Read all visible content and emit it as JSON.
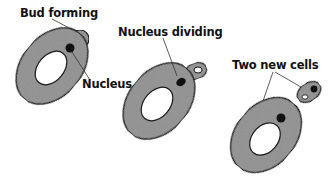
{
  "diagram": {
    "stages": [
      {
        "id": "stage-1",
        "labels": [
          "Bud forming",
          "Nucleus"
        ]
      },
      {
        "id": "stage-2",
        "labels": [
          "Nucleus dividing"
        ]
      },
      {
        "id": "stage-3",
        "labels": [
          "Two new cells"
        ]
      }
    ],
    "colors": {
      "cell_fill": "#9a9a9a",
      "outline": "#1a1a1a",
      "nucleus": "#111111",
      "background": "#ffffff"
    }
  }
}
